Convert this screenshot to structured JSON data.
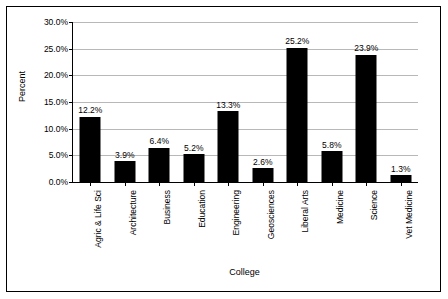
{
  "chart_data": {
    "type": "bar",
    "title": "",
    "xlabel": "College",
    "ylabel": "Percent",
    "ylim": [
      0,
      30
    ],
    "yticks": [
      "0.0%",
      "5.0%",
      "10.0%",
      "15.0%",
      "20.0%",
      "25.0%",
      "30.0%"
    ],
    "ytick_values": [
      0,
      5,
      10,
      15,
      20,
      25,
      30
    ],
    "grid": true,
    "legend": "none",
    "categories": [
      "Agric & Life Sci",
      "Architecture",
      "Business",
      "Education",
      "Engineering",
      "Geosciences",
      "Liberal Arts",
      "Medicine",
      "Science",
      "Vet Medicine"
    ],
    "values": [
      12.2,
      3.9,
      6.4,
      5.2,
      13.3,
      2.6,
      25.2,
      5.8,
      23.9,
      1.3
    ],
    "value_labels": [
      "12.2%",
      "3.9%",
      "6.4%",
      "5.2%",
      "13.3%",
      "2.6%",
      "25.2%",
      "5.8%",
      "23.9%",
      "1.3%"
    ],
    "bar_color": "#000000"
  }
}
